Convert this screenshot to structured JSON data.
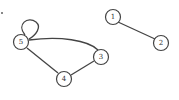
{
  "graph": {
    "nodes": [
      {
        "id": "1",
        "label": "1",
        "x": 113,
        "y": 17
      },
      {
        "id": "2",
        "label": "2",
        "x": 161,
        "y": 43
      },
      {
        "id": "3",
        "label": "3",
        "x": 101,
        "y": 57
      },
      {
        "id": "4",
        "label": "4",
        "x": 64,
        "y": 79
      },
      {
        "id": "5",
        "label": "5",
        "x": 21,
        "y": 42
      }
    ],
    "edges": [
      {
        "from": "1",
        "to": "2"
      },
      {
        "from": "5",
        "to": "3",
        "curved": true
      },
      {
        "from": "5",
        "to": "4"
      },
      {
        "from": "4",
        "to": "3"
      },
      {
        "from": "5",
        "to": "5",
        "loop": true
      }
    ]
  }
}
